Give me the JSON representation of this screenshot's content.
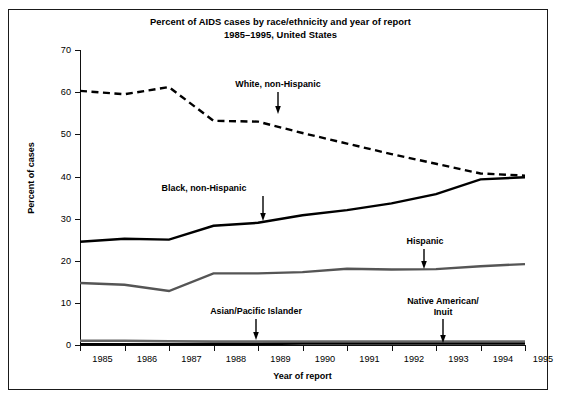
{
  "figure": {
    "title_line1": "Percent of AIDS cases by race/ethnicity and year of report",
    "title_line2": "1985–1995, United States"
  },
  "axes": {
    "y_title": "Percent of cases",
    "x_title": "Year of report",
    "y_ticks": [
      "0",
      "10",
      "20",
      "30",
      "40",
      "50",
      "60",
      "70"
    ],
    "x_ticks": [
      "1985",
      "1986",
      "1987",
      "1988",
      "1989",
      "1990",
      "1991",
      "1992",
      "1993",
      "1994",
      "1995"
    ]
  },
  "annotations": [
    {
      "name": "white-non-hispanic",
      "label": "White, non-Hispanic"
    },
    {
      "name": "black-non-hispanic",
      "label": "Black, non-Hispanic"
    },
    {
      "name": "hispanic",
      "label": "Hispanic"
    },
    {
      "name": "asian-pacific-islander",
      "label": "Asian/Pacific Islander"
    },
    {
      "name": "native-american-inuit-l1",
      "label": "Native American/"
    },
    {
      "name": "native-american-inuit-l2",
      "label": "Inuit"
    }
  ],
  "colors": {
    "white_non_hispanic": "#000000",
    "black_non_hispanic": "#000000",
    "hispanic": "#555555",
    "asian_pacific_islander": "#666666",
    "native_american_inuit": "#000000",
    "axis": "#111111",
    "background": "#ffffff"
  },
  "chart_data": {
    "type": "line",
    "title": "Percent of AIDS cases by race/ethnicity and year of report 1985–1995, United States",
    "xlabel": "Year of report",
    "ylabel": "Percent of cases",
    "x": [
      1985,
      1986,
      1987,
      1988,
      1989,
      1990,
      1991,
      1992,
      1993,
      1994,
      1995
    ],
    "xlim": [
      1985,
      1995
    ],
    "ylim": [
      0,
      70
    ],
    "ytick_step": 10,
    "grid": false,
    "legend": "inline-annotations",
    "series": [
      {
        "name": "White, non-Hispanic",
        "style": "dashed",
        "color": "#000000",
        "values": [
          60.3,
          59.5,
          61.2,
          53.2,
          53.0,
          50.3,
          47.8,
          45.3,
          43.0,
          40.7,
          40.2
        ]
      },
      {
        "name": "Black, non-Hispanic",
        "style": "solid",
        "color": "#000000",
        "values": [
          24.5,
          25.2,
          25.0,
          28.3,
          29.0,
          30.8,
          32.0,
          33.6,
          35.8,
          39.3,
          39.8
        ]
      },
      {
        "name": "Hispanic",
        "style": "solid",
        "color": "#555555",
        "values": [
          14.7,
          14.3,
          12.8,
          17.0,
          17.0,
          17.3,
          18.1,
          17.9,
          18.0,
          18.7,
          19.2
        ]
      },
      {
        "name": "Asian/Pacific Islander",
        "style": "solid",
        "color": "#666666",
        "values": [
          1.0,
          1.0,
          0.9,
          0.8,
          0.8,
          0.8,
          0.8,
          0.8,
          0.8,
          0.8,
          0.8
        ]
      },
      {
        "name": "Native American/Inuit",
        "style": "solid",
        "color": "#000000",
        "values": [
          0.2,
          0.2,
          0.2,
          0.2,
          0.2,
          0.3,
          0.3,
          0.3,
          0.3,
          0.3,
          0.3
        ]
      }
    ]
  }
}
